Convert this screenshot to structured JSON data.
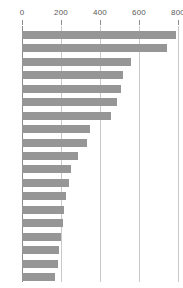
{
  "chart_data": {
    "type": "bar",
    "orientation": "horizontal",
    "title": "",
    "subtitle": "",
    "xlabel": "",
    "ylabel": "",
    "xlim": [
      0,
      800
    ],
    "ylim": null,
    "grid": true,
    "grid_axis": "x",
    "legend": null,
    "legend_position": "none",
    "bar_color": "#969696",
    "gridline_color": "#c9c9c9",
    "axis_color": "#8c8c8c",
    "tick_label_color": "#5a5a5a",
    "background": "#ffffff",
    "xticks": [
      0,
      200,
      400,
      600,
      800
    ],
    "xtick_labels": [
      "0",
      "200",
      "400",
      "600",
      "800"
    ],
    "categories": [
      "",
      "",
      "",
      "",
      "",
      "",
      "",
      "",
      "",
      "",
      "",
      "",
      "",
      "",
      "",
      "",
      "",
      "",
      ""
    ],
    "ytick_labels": [],
    "values": [
      790,
      744,
      561,
      517,
      506,
      489,
      456,
      350,
      333,
      289,
      250,
      239,
      228,
      217,
      211,
      200,
      189,
      183,
      167
    ],
    "bar_count": 19,
    "sorted": "descending",
    "annotations": []
  }
}
